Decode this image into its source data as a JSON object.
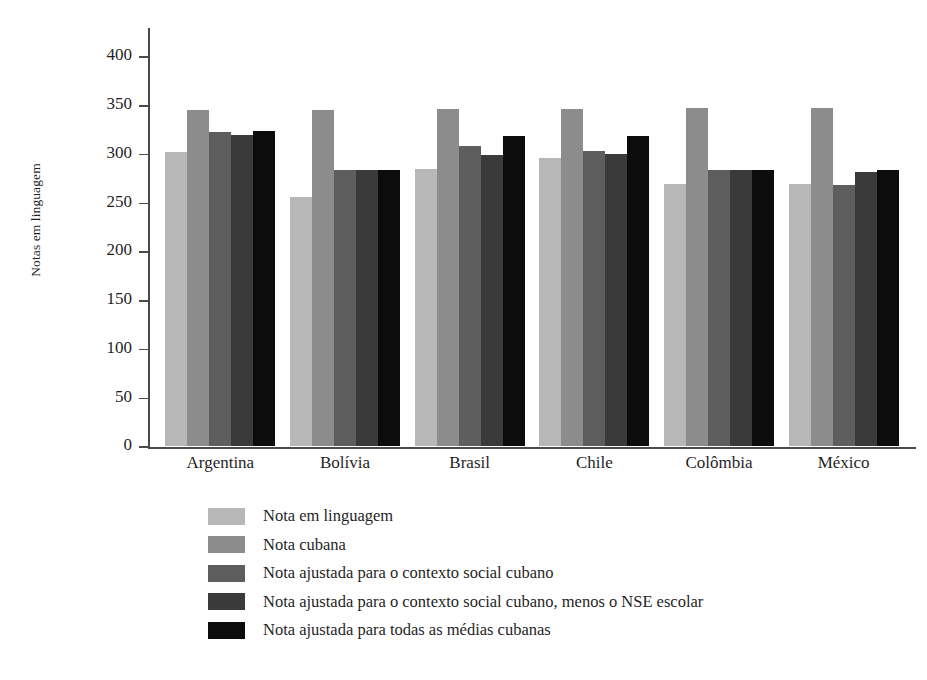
{
  "chart_data": {
    "type": "bar",
    "title": "",
    "xlabel": "",
    "ylabel": "Notas em linguagem",
    "categories": [
      "Argentina",
      "Bolívia",
      "Brasil",
      "Chile",
      "Colômbia",
      "México"
    ],
    "ylim": [
      0,
      425
    ],
    "yticks": [
      0,
      50,
      100,
      150,
      200,
      250,
      300,
      350,
      400
    ],
    "ytick_labels": [
      "0",
      "50",
      "100",
      "150",
      "200",
      "250",
      "300",
      "350",
      "400"
    ],
    "grid": false,
    "legend_position": "below-axes-left",
    "series": [
      {
        "name": "Nota em linguagem",
        "color": "#b7b7b7",
        "values": [
          302,
          256,
          285,
          296,
          269,
          269
        ]
      },
      {
        "name": "Nota cubana",
        "color": "#8c8c8c",
        "values": [
          345,
          345,
          346,
          346,
          347,
          347
        ]
      },
      {
        "name": "Nota ajustada para o contexto social cubano",
        "color": "#5e5e5e",
        "values": [
          322,
          283,
          308,
          303,
          284,
          268
        ]
      },
      {
        "name": "Nota ajustada para o contexto social cubano, menos o NSE escolar",
        "color": "#3a3a3a",
        "values": [
          319,
          283,
          299,
          300,
          284,
          281
        ]
      },
      {
        "name": "Nota ajustada para todas as médias cubanas",
        "color": "#0c0c0c",
        "values": [
          323,
          283,
          318,
          318,
          284,
          284
        ]
      }
    ]
  }
}
